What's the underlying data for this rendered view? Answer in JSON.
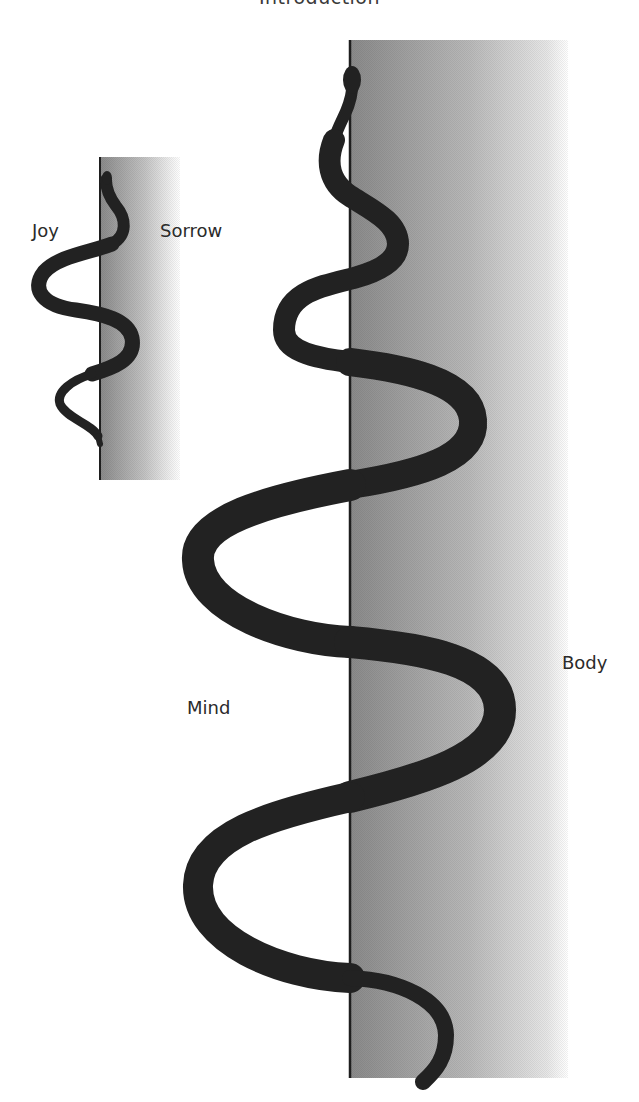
{
  "header": {
    "title": "Introduction"
  },
  "small_diagram": {
    "left_label": "Joy",
    "right_label": "Sorrow"
  },
  "large_diagram": {
    "left_label": "Mind",
    "right_label": "Body"
  },
  "colors": {
    "snake": "#222222",
    "divider_line": "#1e1e1e",
    "gradient_dark": "#888888",
    "gradient_light": "#ffffff",
    "background": "#ffffff",
    "text": "#2b2b2b"
  }
}
